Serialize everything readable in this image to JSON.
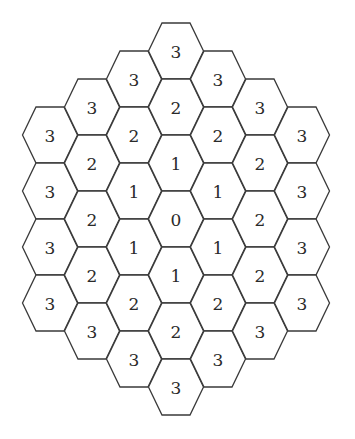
{
  "diagram": {
    "type": "hexagonal-grid-distance-map",
    "orientation": "flat-top",
    "stroke_color": "#3a3a3a",
    "fill_color": "#ffffff",
    "geometry": {
      "half_width": 27.5,
      "half_top_edge": 14,
      "half_height": 28,
      "column_spacing": 42,
      "row_spacing": 56,
      "center_x": 176,
      "center_y": 219
    },
    "columns": [
      {
        "col": -3,
        "values": [
          "3",
          "3",
          "3",
          "3"
        ]
      },
      {
        "col": -2,
        "values": [
          "3",
          "2",
          "2",
          "2",
          "3"
        ]
      },
      {
        "col": -1,
        "values": [
          "3",
          "2",
          "1",
          "1",
          "2",
          "3"
        ]
      },
      {
        "col": 0,
        "values": [
          "3",
          "2",
          "1",
          "0",
          "1",
          "2",
          "3"
        ]
      },
      {
        "col": 1,
        "values": [
          "3",
          "2",
          "1",
          "1",
          "2",
          "3"
        ]
      },
      {
        "col": 2,
        "values": [
          "3",
          "2",
          "2",
          "2",
          "3"
        ]
      },
      {
        "col": 3,
        "values": [
          "3",
          "3",
          "3",
          "3"
        ]
      }
    ]
  }
}
